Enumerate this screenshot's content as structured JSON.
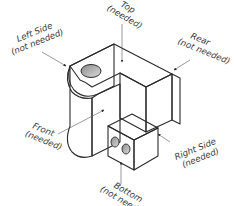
{
  "diagram": {
    "labels": {
      "top": {
        "name": "Top",
        "status": "(needed)"
      },
      "rear": {
        "name": "Rear",
        "status": "(not needed)"
      },
      "left": {
        "name": "Left Side",
        "status": "(not needed)"
      },
      "front": {
        "name": "Front",
        "status": "(needed)"
      },
      "right": {
        "name": "Right Side",
        "status": "(needed)"
      },
      "bottom": {
        "name": "Bottom",
        "status": "(not needed)"
      }
    },
    "colors": {
      "line": "#2a2a2a",
      "shade_light": "#e6e6e6",
      "shade_mid": "#cfcfcf",
      "shade_dark": "#b5b5b5",
      "text": "#3a3a3a"
    }
  }
}
